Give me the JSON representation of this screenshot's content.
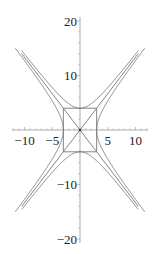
{
  "chart_data": {
    "type": "line",
    "title": "",
    "xlabel": "",
    "ylabel": "",
    "xlim": [
      -12,
      12.5
    ],
    "ylim": [
      -20.5,
      20.5
    ],
    "grid": false,
    "legend": null,
    "x_ticks": [
      -10,
      -5,
      5,
      10
    ],
    "y_ticks": [
      -20,
      -10,
      10,
      20
    ],
    "x_tick_labels": [
      "−10",
      "−5",
      "5",
      "10"
    ],
    "y_tick_labels": [
      "−20",
      "−10",
      "10",
      "20"
    ],
    "series": [
      {
        "name": "hyperbola y^2/16 - x^2/9 = 1 (upper/lower branches)",
        "a": 4,
        "b": 3
      },
      {
        "name": "conjugate hyperbola x^2/9 - y^2/16 = 1 (left/right branches)",
        "a": 3,
        "b": 4
      },
      {
        "name": "asymptote y = 4x/3",
        "slope": 1.3333
      },
      {
        "name": "asymptote y = -4x/3",
        "slope": -1.3333
      },
      {
        "name": "fundamental rectangle",
        "x": [
          -3,
          3
        ],
        "y": [
          -4,
          4
        ]
      }
    ],
    "line_color": "#777777",
    "axis_color": "#999999"
  }
}
